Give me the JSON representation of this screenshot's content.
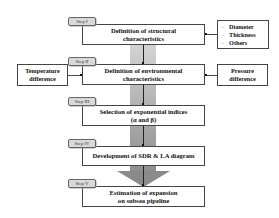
{
  "diagram": {
    "type": "flowchart",
    "steps": [
      {
        "tag": "Step I",
        "label_line1": "Definition  of structural",
        "label_line2": "characteristics"
      },
      {
        "tag": "Step II",
        "label_line1": "Definition  of environmental",
        "label_line2": "characteristics"
      },
      {
        "tag": "Step III",
        "label_line1": "Selection of exponential  indices",
        "label_line2": "(α and β)"
      },
      {
        "tag": "Step IV",
        "label_line1": "Development of SDR & LA diagram",
        "label_line2": ""
      },
      {
        "tag": "Step V",
        "label_line1": "Estimation  of expansion",
        "label_line2": "on subsea pipeline"
      }
    ],
    "structural_inputs": {
      "items": [
        {
          "bullet": "-",
          "label": "Diameter"
        },
        {
          "bullet": "-",
          "label": "Thickness"
        },
        {
          "bullet": "-",
          "label": "Others"
        }
      ]
    },
    "temperature_input": {
      "line1": "Temperature",
      "line2": "difference"
    },
    "pressure_input": {
      "line1": "Pressure",
      "line2": "difference"
    },
    "colors": {
      "arrow_light": "#d4d4d4",
      "arrow_dark": "#8e8e8e",
      "tag_fill": "#d9d9d9",
      "border": "#444444"
    }
  }
}
